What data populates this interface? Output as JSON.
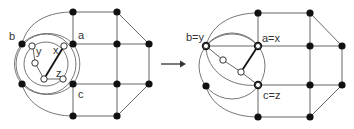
{
  "figure": {
    "left_graph": {
      "labels": {
        "a": "a",
        "b": "b",
        "c": "c",
        "x": "x",
        "y": "y",
        "z": "z"
      }
    },
    "arrow": {
      "direction": "right"
    },
    "right_graph": {
      "labels": {
        "by": "b=y",
        "ax": "a=x",
        "cz": "c=z"
      }
    },
    "colors": {
      "black_node": "#111111",
      "white_node": "#ffffff",
      "edge": "#555555"
    }
  }
}
